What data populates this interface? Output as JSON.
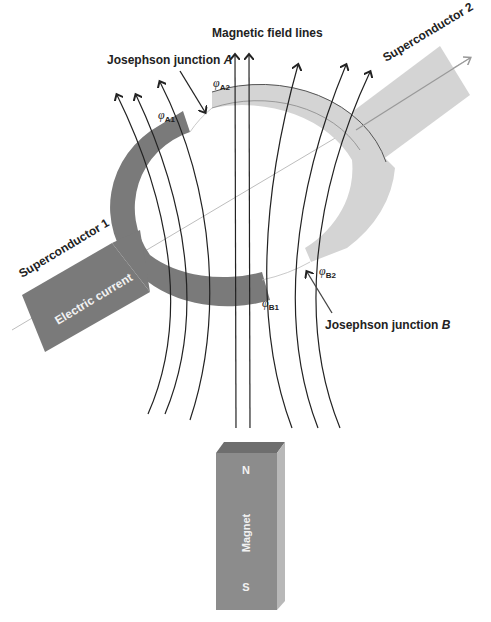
{
  "diagram": {
    "title": "Magnetic field lines",
    "labels": {
      "field_lines": "Magnetic field lines",
      "junction_a": "Josephson junction ",
      "junction_a_letter": "A",
      "junction_b": "Josephson junction ",
      "junction_b_letter": "B",
      "superconductor_1": "Superconductor 1",
      "superconductor_2": "Superconductor 2",
      "electric_current": "Electric current",
      "magnet": "Magnet",
      "north": "N",
      "south": "S"
    },
    "phases": {
      "a1": {
        "symbol": "φ",
        "sub": "A1"
      },
      "a2": {
        "symbol": "φ",
        "sub": "A2"
      },
      "b1": {
        "symbol": "φ",
        "sub": "B1"
      },
      "b2": {
        "symbol": "φ",
        "sub": "B2"
      }
    },
    "colors": {
      "superconductor_1": "#7a7a7a",
      "superconductor_2": "#d2d2d2",
      "magnet_front": "#8c8c8c",
      "magnet_top": "#6e6e6e",
      "magnet_side": "#b4b4b4",
      "field_line": "#222222",
      "current_line": "#9a9a9a"
    }
  }
}
